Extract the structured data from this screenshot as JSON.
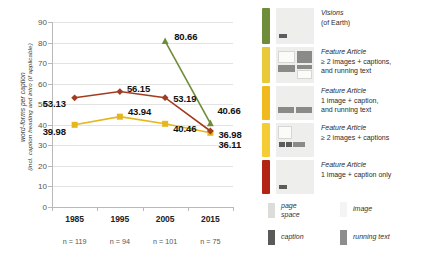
{
  "chart_data": {
    "type": "line",
    "title": "",
    "xlabel": "",
    "ylabel": "word-forms per caption",
    "ylabel2": "(incl. caption heading and intro (if applicable)",
    "categories": [
      "1985",
      "1995",
      "2005",
      "2015"
    ],
    "sample_sizes": [
      "n = 119",
      "n = 94",
      "n = 101",
      "n = 75"
    ],
    "ylim": [
      0,
      90
    ],
    "yticks": [
      0,
      10,
      20,
      30,
      40,
      50,
      60,
      70,
      80,
      90
    ],
    "grid": true,
    "legend_position": "right",
    "series": [
      {
        "name": "Visions (of Earth)",
        "color": "#6f8c38",
        "marker": "triangle",
        "x": [
          "2005",
          "2015"
        ],
        "values": [
          80.66,
          40.66
        ],
        "labels": [
          "80.66",
          "40.66"
        ]
      },
      {
        "name": "Feature Article ≥ 2 images + captions, and running text",
        "color": "#e6b61c",
        "marker": "square",
        "x": [
          "1985",
          "1995",
          "2005",
          "2015"
        ],
        "values": [
          39.98,
          43.94,
          40.46,
          36.11
        ],
        "labels": [
          "39.98",
          "43.94",
          "40.46",
          "36.11"
        ]
      },
      {
        "name": "Feature Article 1 image + caption, and running text",
        "color": "#a33b20",
        "marker": "diamond",
        "x": [
          "1985",
          "1995",
          "2005",
          "2015"
        ],
        "values": [
          53.13,
          56.15,
          53.19,
          36.98
        ],
        "labels": [
          "53.13",
          "56.15",
          "53.19",
          "36.98"
        ]
      }
    ]
  },
  "legend": {
    "entries": [
      {
        "color": "#6f8c38",
        "line1": "Visions",
        "line2": "(of Earth)",
        "line3": ""
      },
      {
        "color": "#e9c93a",
        "line1": "Feature Article",
        "line2": "≥ 2 images + captions,",
        "line3": "and running text"
      },
      {
        "color": "#f0ba1e",
        "line1": "Feature Article",
        "line2": "1 image + caption,",
        "line3": "and running text"
      },
      {
        "color": "#f5cc33",
        "line1": "Feature Article",
        "line2": "≥ 2 images + captions",
        "line3": ""
      },
      {
        "color": "#b32415",
        "line1": "Feature Article",
        "line2": "1 image + caption only",
        "line3": ""
      }
    ],
    "keys": [
      {
        "id": "page-space",
        "color": "#dcdcd8",
        "line1": "page",
        "line2": "space"
      },
      {
        "id": "image",
        "color": "#f4f4f2",
        "line1": "image",
        "line2": ""
      },
      {
        "id": "caption",
        "color": "#5a5a58",
        "line1": "caption",
        "line2": ""
      },
      {
        "id": "running-text",
        "color": "#8d8d8b",
        "line1": "running text",
        "line2": ""
      }
    ]
  }
}
